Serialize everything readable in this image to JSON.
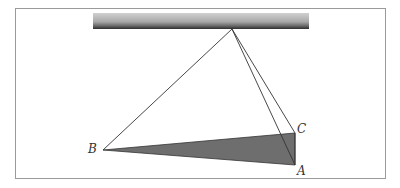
{
  "figure": {
    "labels": {
      "A": "A",
      "B": "B",
      "C": "C"
    },
    "colors": {
      "frame": "#9a9a9a",
      "bar_top": "#c8c8c8",
      "bar_bottom": "#3a3a3a",
      "shade": "#6e6e6e",
      "line": "#333333"
    }
  }
}
